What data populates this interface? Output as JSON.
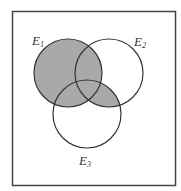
{
  "diagram": {
    "type": "venn",
    "sets": [
      {
        "id": "E1",
        "letter": "E",
        "subscript": "1"
      },
      {
        "id": "E2",
        "letter": "E",
        "subscript": "2"
      },
      {
        "id": "E3",
        "letter": "E",
        "subscript": "3"
      }
    ],
    "shaded_region": "E1 ∪ (E2 ∩ E3)",
    "colors": {
      "shade": "#a9a9a9",
      "stroke": "#333333",
      "frame": "#444444",
      "background": "#ffffff"
    }
  }
}
